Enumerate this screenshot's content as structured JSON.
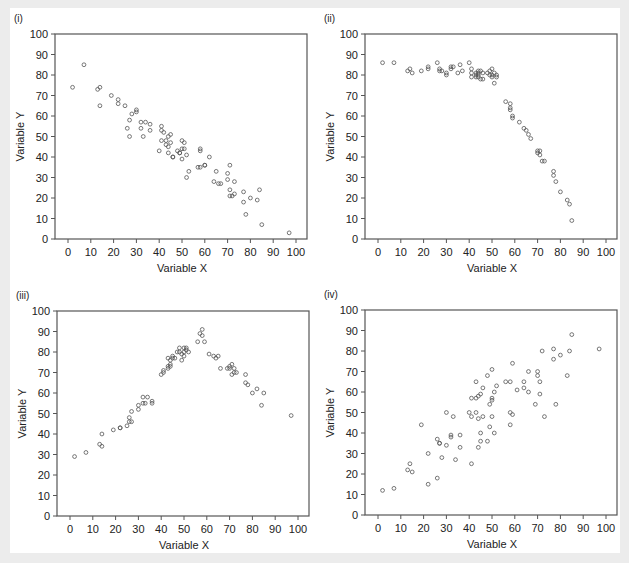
{
  "figure": {
    "background": "#ececec",
    "panel_background": "#ffffff",
    "marker_color": "#555555",
    "frame_color": "#555555"
  },
  "chart_data": [
    {
      "id": "i",
      "label": "(i)",
      "type": "scatter",
      "title": "",
      "xlabel": "Variable X",
      "ylabel": "Variable Y",
      "xlim": [
        0,
        100
      ],
      "ylim": [
        0,
        100
      ],
      "xticks": [
        0,
        10,
        20,
        30,
        40,
        50,
        60,
        70,
        80,
        90,
        100
      ],
      "yticks": [
        0,
        10,
        20,
        30,
        40,
        50,
        60,
        70,
        80,
        90,
        100
      ],
      "grid": false,
      "points": [
        [
          2,
          74
        ],
        [
          7,
          85
        ],
        [
          13,
          73
        ],
        [
          14,
          74
        ],
        [
          14,
          65
        ],
        [
          19,
          70
        ],
        [
          22,
          66
        ],
        [
          22,
          68
        ],
        [
          25,
          65
        ],
        [
          26,
          54
        ],
        [
          27,
          50
        ],
        [
          27,
          58
        ],
        [
          28,
          61
        ],
        [
          30,
          63
        ],
        [
          30,
          62
        ],
        [
          32,
          57
        ],
        [
          32,
          54
        ],
        [
          33,
          50
        ],
        [
          34,
          57
        ],
        [
          36,
          56
        ],
        [
          36,
          53
        ],
        [
          40,
          43
        ],
        [
          41,
          55
        ],
        [
          41,
          53
        ],
        [
          41,
          48
        ],
        [
          42,
          52
        ],
        [
          43,
          46
        ],
        [
          43,
          48
        ],
        [
          44,
          50
        ],
        [
          44,
          45
        ],
        [
          44,
          42
        ],
        [
          45,
          51
        ],
        [
          45,
          47
        ],
        [
          46,
          40
        ],
        [
          46,
          40
        ],
        [
          48,
          43
        ],
        [
          49,
          42
        ],
        [
          49,
          42
        ],
        [
          50,
          48
        ],
        [
          50,
          44
        ],
        [
          50,
          39
        ],
        [
          51,
          47
        ],
        [
          51,
          44
        ],
        [
          52,
          41
        ],
        [
          52,
          30
        ],
        [
          53,
          33
        ],
        [
          57,
          35
        ],
        [
          58,
          35
        ],
        [
          58,
          44
        ],
        [
          58,
          43
        ],
        [
          60,
          36
        ],
        [
          60,
          36
        ],
        [
          62,
          40
        ],
        [
          64,
          28
        ],
        [
          65,
          33
        ],
        [
          66,
          27
        ],
        [
          67,
          27
        ],
        [
          70,
          29
        ],
        [
          70,
          32
        ],
        [
          71,
          24
        ],
        [
          71,
          36
        ],
        [
          71,
          21
        ],
        [
          72,
          21
        ],
        [
          73,
          28
        ],
        [
          73,
          22
        ],
        [
          77,
          23
        ],
        [
          77,
          18
        ],
        [
          78,
          12
        ],
        [
          80,
          20
        ],
        [
          83,
          19
        ],
        [
          84,
          24
        ],
        [
          85,
          7
        ],
        [
          97,
          3
        ]
      ]
    },
    {
      "id": "ii",
      "label": "(ii)",
      "type": "scatter",
      "title": "",
      "xlabel": "Variable X",
      "ylabel": "Variable Y",
      "xlim": [
        0,
        100
      ],
      "ylim": [
        0,
        100
      ],
      "xticks": [
        0,
        10,
        20,
        30,
        40,
        50,
        60,
        70,
        80,
        90,
        100
      ],
      "yticks": [
        0,
        10,
        20,
        30,
        40,
        50,
        60,
        70,
        80,
        90,
        100
      ],
      "grid": false,
      "points": [
        [
          2,
          86
        ],
        [
          7,
          86
        ],
        [
          13,
          82
        ],
        [
          14,
          83
        ],
        [
          15,
          81
        ],
        [
          19,
          82
        ],
        [
          22,
          83
        ],
        [
          22,
          84
        ],
        [
          26,
          86
        ],
        [
          27,
          83
        ],
        [
          27,
          82
        ],
        [
          28,
          82
        ],
        [
          30,
          80
        ],
        [
          30,
          81
        ],
        [
          32,
          84
        ],
        [
          32,
          83
        ],
        [
          33,
          84
        ],
        [
          35,
          81
        ],
        [
          36,
          85
        ],
        [
          37,
          82
        ],
        [
          40,
          86
        ],
        [
          41,
          83
        ],
        [
          41,
          81
        ],
        [
          41,
          79
        ],
        [
          43,
          80
        ],
        [
          43,
          81
        ],
        [
          43,
          79
        ],
        [
          44,
          82
        ],
        [
          44,
          81
        ],
        [
          44,
          80
        ],
        [
          44,
          79
        ],
        [
          45,
          82
        ],
        [
          45,
          78
        ],
        [
          46,
          81
        ],
        [
          46,
          78
        ],
        [
          48,
          81
        ],
        [
          49,
          80
        ],
        [
          49,
          82
        ],
        [
          50,
          83
        ],
        [
          50,
          80
        ],
        [
          50,
          79
        ],
        [
          51,
          76
        ],
        [
          51,
          81
        ],
        [
          52,
          80
        ],
        [
          52,
          79
        ],
        [
          56,
          67
        ],
        [
          58,
          66
        ],
        [
          58,
          64
        ],
        [
          58,
          63
        ],
        [
          59,
          59
        ],
        [
          59,
          60
        ],
        [
          62,
          57
        ],
        [
          64,
          54
        ],
        [
          65,
          53
        ],
        [
          66,
          51
        ],
        [
          67,
          49
        ],
        [
          70,
          43
        ],
        [
          70,
          42
        ],
        [
          71,
          43
        ],
        [
          71,
          41
        ],
        [
          72,
          38
        ],
        [
          73,
          38
        ],
        [
          77,
          33
        ],
        [
          77,
          31
        ],
        [
          78,
          28
        ],
        [
          80,
          23
        ],
        [
          83,
          19
        ],
        [
          84,
          17
        ],
        [
          85,
          9
        ]
      ]
    },
    {
      "id": "iii",
      "label": "(iii)",
      "type": "scatter",
      "title": "",
      "xlabel": "Variable X",
      "ylabel": "Variable Y",
      "xlim": [
        0,
        100
      ],
      "ylim": [
        0,
        100
      ],
      "xticks": [
        0,
        10,
        20,
        30,
        40,
        50,
        60,
        70,
        80,
        90,
        100
      ],
      "yticks": [
        0,
        10,
        20,
        30,
        40,
        50,
        60,
        70,
        80,
        90,
        100
      ],
      "grid": false,
      "points": [
        [
          2,
          29
        ],
        [
          7,
          31
        ],
        [
          13,
          35
        ],
        [
          14,
          34
        ],
        [
          14,
          40
        ],
        [
          19,
          42
        ],
        [
          22,
          43
        ],
        [
          22,
          43
        ],
        [
          25,
          44
        ],
        [
          26,
          48
        ],
        [
          26,
          46
        ],
        [
          27,
          46
        ],
        [
          27,
          51
        ],
        [
          30,
          54
        ],
        [
          30,
          52
        ],
        [
          32,
          58
        ],
        [
          32,
          55
        ],
        [
          33,
          55
        ],
        [
          34,
          58
        ],
        [
          36,
          56
        ],
        [
          36,
          55
        ],
        [
          40,
          69
        ],
        [
          41,
          71
        ],
        [
          41,
          70
        ],
        [
          43,
          77
        ],
        [
          43,
          73
        ],
        [
          43,
          72
        ],
        [
          44,
          76
        ],
        [
          44,
          74
        ],
        [
          44,
          73
        ],
        [
          45,
          78
        ],
        [
          45,
          77
        ],
        [
          46,
          77
        ],
        [
          47,
          80
        ],
        [
          48,
          82
        ],
        [
          48,
          80
        ],
        [
          49,
          79
        ],
        [
          49,
          76
        ],
        [
          50,
          82
        ],
        [
          50,
          80
        ],
        [
          50,
          78
        ],
        [
          51,
          82
        ],
        [
          51,
          81
        ],
        [
          52,
          80
        ],
        [
          56,
          85
        ],
        [
          57,
          89
        ],
        [
          58,
          88
        ],
        [
          58,
          91
        ],
        [
          59,
          85
        ],
        [
          61,
          79
        ],
        [
          63,
          78
        ],
        [
          64,
          77
        ],
        [
          65,
          78
        ],
        [
          66,
          72
        ],
        [
          69,
          72
        ],
        [
          70,
          73
        ],
        [
          70,
          72
        ],
        [
          71,
          74
        ],
        [
          71,
          69
        ],
        [
          72,
          72
        ],
        [
          72,
          70
        ],
        [
          73,
          70
        ],
        [
          77,
          69
        ],
        [
          77,
          65
        ],
        [
          78,
          64
        ],
        [
          80,
          60
        ],
        [
          82,
          62
        ],
        [
          84,
          54
        ],
        [
          85,
          60
        ],
        [
          97,
          49
        ]
      ]
    },
    {
      "id": "iv",
      "label": "(iv)",
      "type": "scatter",
      "title": "",
      "xlabel": "Variable X",
      "ylabel": "Variable Y",
      "xlim": [
        0,
        100
      ],
      "ylim": [
        0,
        100
      ],
      "xticks": [
        0,
        10,
        20,
        30,
        40,
        50,
        60,
        70,
        80,
        90,
        100
      ],
      "yticks": [
        0,
        10,
        20,
        30,
        40,
        50,
        60,
        70,
        80,
        90,
        100
      ],
      "grid": false,
      "points": [
        [
          2,
          12
        ],
        [
          7,
          13
        ],
        [
          13,
          22
        ],
        [
          14,
          25
        ],
        [
          15,
          21
        ],
        [
          19,
          44
        ],
        [
          22,
          30
        ],
        [
          22,
          15
        ],
        [
          26,
          37
        ],
        [
          26,
          18
        ],
        [
          27,
          35
        ],
        [
          27,
          35
        ],
        [
          28,
          28
        ],
        [
          30,
          50
        ],
        [
          30,
          34
        ],
        [
          32,
          39
        ],
        [
          32,
          38
        ],
        [
          33,
          48
        ],
        [
          34,
          27
        ],
        [
          36,
          39
        ],
        [
          36,
          33
        ],
        [
          40,
          50
        ],
        [
          41,
          57
        ],
        [
          41,
          48
        ],
        [
          41,
          25
        ],
        [
          43,
          57
        ],
        [
          43,
          50
        ],
        [
          43,
          65
        ],
        [
          44,
          58
        ],
        [
          44,
          47
        ],
        [
          44,
          33
        ],
        [
          45,
          59
        ],
        [
          45,
          40
        ],
        [
          45,
          36
        ],
        [
          46,
          62
        ],
        [
          46,
          48
        ],
        [
          48,
          68
        ],
        [
          48,
          36
        ],
        [
          49,
          54
        ],
        [
          49,
          43
        ],
        [
          50,
          71
        ],
        [
          50,
          57
        ],
        [
          50,
          56
        ],
        [
          50,
          48
        ],
        [
          51,
          60
        ],
        [
          51,
          40
        ],
        [
          52,
          63
        ],
        [
          56,
          65
        ],
        [
          58,
          65
        ],
        [
          58,
          50
        ],
        [
          58,
          44
        ],
        [
          59,
          74
        ],
        [
          59,
          49
        ],
        [
          61,
          61
        ],
        [
          64,
          62
        ],
        [
          64,
          65
        ],
        [
          66,
          60
        ],
        [
          66,
          70
        ],
        [
          69,
          54
        ],
        [
          70,
          68
        ],
        [
          70,
          70
        ],
        [
          71,
          65
        ],
        [
          71,
          59
        ],
        [
          72,
          80
        ],
        [
          73,
          48
        ],
        [
          77,
          81
        ],
        [
          77,
          76
        ],
        [
          78,
          54
        ],
        [
          80,
          78
        ],
        [
          83,
          68
        ],
        [
          84,
          80
        ],
        [
          85,
          88
        ],
        [
          97,
          81
        ]
      ]
    }
  ]
}
